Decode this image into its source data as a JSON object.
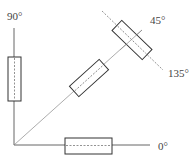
{
  "diagram": {
    "type": "polarizer-orientation-diagram",
    "labels": {
      "deg90": "90°",
      "deg45": "45°",
      "deg135": "135°",
      "deg0": "0°"
    },
    "elements": [
      {
        "name": "vertical-axis",
        "angle": 90
      },
      {
        "name": "horizontal-axis",
        "angle": 0
      },
      {
        "name": "diagonal-axis",
        "angle": 45
      },
      {
        "name": "rect-90",
        "orientation": "vertical",
        "on_axis": "90°"
      },
      {
        "name": "rect-0",
        "orientation": "horizontal",
        "on_axis": "0°"
      },
      {
        "name": "rect-45",
        "orientation": "45°",
        "on_axis": "45°"
      },
      {
        "name": "rect-135",
        "orientation": "135° (perpendicular)",
        "on_axis": "45°/135° intersection"
      }
    ],
    "colors": {
      "line": "#555555",
      "box_stroke": "#333333",
      "text": "#444444"
    }
  }
}
